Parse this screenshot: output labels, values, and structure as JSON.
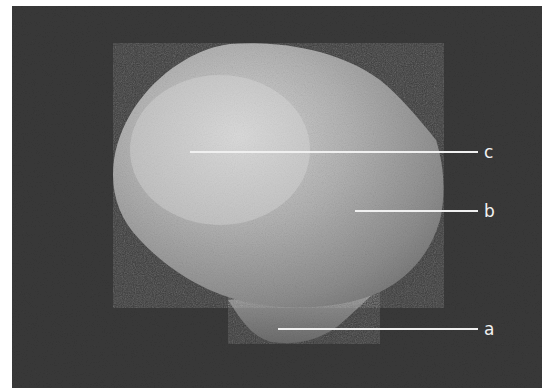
{
  "figure": {
    "background_color": "#3a3a3a",
    "bone_color": "#b8b8b8",
    "leader_line_color": "#f0f0f0",
    "labels": [
      {
        "id": "c",
        "text": "c",
        "line": {
          "x1": 190,
          "y1": 152,
          "x2": 478,
          "y2": 152
        },
        "text_x": 484,
        "text_y": 158
      },
      {
        "id": "b",
        "text": "b",
        "line": {
          "x1": 355,
          "y1": 211,
          "x2": 478,
          "y2": 211
        },
        "text_x": 484,
        "text_y": 217
      },
      {
        "id": "a",
        "text": "a",
        "line": {
          "x1": 278,
          "y1": 329,
          "x2": 478,
          "y2": 329
        },
        "text_x": 484,
        "text_y": 335
      }
    ]
  }
}
